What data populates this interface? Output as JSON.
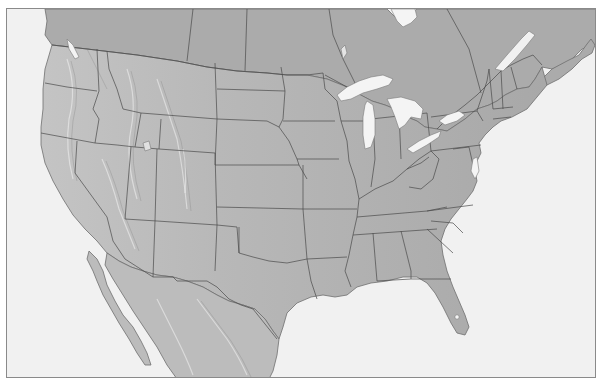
{
  "map": {
    "type": "shaded-relief outline map",
    "region": "Contiguous United States with southern Canada and northern Mexico",
    "labels": [],
    "colors": {
      "ocean": "#f1f1f1",
      "land": "#b4b4b4",
      "land_canada": "#a9a9a9",
      "land_mexico": "#bdbdbd",
      "borders": "#4a4a4a",
      "lakes": "#f4f4f4",
      "frame": "#8a8a8a"
    },
    "features": {
      "great_lakes": [
        "Lake Superior",
        "Lake Michigan",
        "Lake Huron",
        "Lake Erie",
        "Lake Ontario"
      ],
      "other_water": [
        "Great Salt Lake",
        "Hudson Bay (edge)",
        "Gulf of St. Lawrence",
        "Lake Okeechobee"
      ],
      "state_borders_shown": true,
      "international_borders_shown": true
    }
  }
}
